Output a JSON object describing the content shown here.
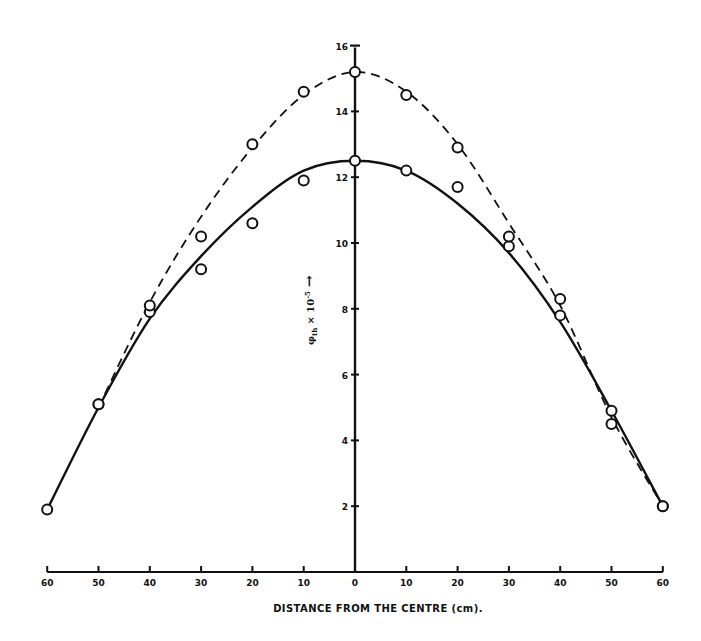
{
  "chart_data": {
    "type": "line",
    "title": "",
    "xlabel": "DISTANCE FROM THE CENTRE (cm).",
    "ylabel": "φth × 10⁻⁵ →",
    "ylabel_parts": {
      "symbol": "φ",
      "sub": "th",
      "times": "× 10",
      "exp": "-5",
      "arrow": "→"
    },
    "x_ticks": [
      -60,
      -50,
      -40,
      -30,
      -20,
      -10,
      0,
      10,
      20,
      30,
      40,
      50,
      60
    ],
    "x_tick_labels": [
      "60",
      "50",
      "40",
      "30",
      "20",
      "10",
      "0",
      "10",
      "20",
      "30",
      "40",
      "50",
      "60"
    ],
    "y_ticks": [
      2,
      4,
      6,
      8,
      10,
      12,
      14,
      16
    ],
    "y_tick_labels": [
      "2",
      "4",
      "6",
      "8",
      "10",
      "12",
      "14",
      "16"
    ],
    "xlim": [
      -60,
      60
    ],
    "ylim": [
      0,
      16
    ],
    "grid": false,
    "legend": null,
    "series": [
      {
        "name": "solid-curve",
        "style": "solid",
        "points": [
          [
            -60,
            1.9
          ],
          [
            -50,
            5.1
          ],
          [
            -40,
            7.9
          ],
          [
            -30,
            9.2
          ],
          [
            -20,
            10.6
          ],
          [
            -10,
            11.9
          ],
          [
            0,
            12.5
          ],
          [
            10,
            12.2
          ],
          [
            20,
            11.7
          ],
          [
            30,
            9.9
          ],
          [
            40,
            7.8
          ],
          [
            50,
            4.5
          ],
          [
            60,
            2.0
          ]
        ],
        "curve": [
          [
            -60,
            1.9
          ],
          [
            -50,
            5.0
          ],
          [
            -40,
            7.7
          ],
          [
            -30,
            9.6
          ],
          [
            -20,
            11.1
          ],
          [
            -10,
            12.2
          ],
          [
            0,
            12.5
          ],
          [
            10,
            12.2
          ],
          [
            20,
            11.2
          ],
          [
            30,
            9.7
          ],
          [
            40,
            7.6
          ],
          [
            50,
            4.9
          ],
          [
            60,
            2.0
          ]
        ]
      },
      {
        "name": "dashed-curve",
        "style": "dashed",
        "points": [
          [
            -50,
            5.1
          ],
          [
            -40,
            8.1
          ],
          [
            -30,
            10.2
          ],
          [
            -20,
            13.0
          ],
          [
            -10,
            14.6
          ],
          [
            0,
            15.2
          ],
          [
            10,
            14.5
          ],
          [
            20,
            12.9
          ],
          [
            30,
            10.2
          ],
          [
            40,
            8.3
          ],
          [
            50,
            4.9
          ],
          [
            60,
            2.0
          ]
        ],
        "curve": [
          [
            -50,
            5.0
          ],
          [
            -40,
            8.2
          ],
          [
            -30,
            10.8
          ],
          [
            -20,
            12.9
          ],
          [
            -10,
            14.5
          ],
          [
            0,
            15.2
          ],
          [
            10,
            14.6
          ],
          [
            20,
            13.0
          ],
          [
            30,
            10.6
          ],
          [
            40,
            8.1
          ],
          [
            50,
            4.7
          ],
          [
            60,
            2.0
          ]
        ]
      }
    ]
  }
}
